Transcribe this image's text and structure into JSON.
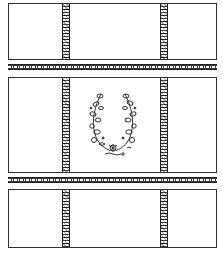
{
  "image": {
    "description": "Line-art pattern sheet: three rectangular panels separated by two decorative horizontal bands, each panel crossed by two decorative vertical strips; the middle panel contains a floral wreath motif",
    "colors": {
      "line": "#333333",
      "background": "#ffffff",
      "band_fill": "#3a3a3a"
    },
    "panels": [
      {
        "id": "top",
        "has_motif": false
      },
      {
        "id": "middle",
        "has_motif": true,
        "motif": "floral-wreath"
      },
      {
        "id": "bottom",
        "has_motif": false
      }
    ],
    "bands": [
      {
        "id": "band-1"
      },
      {
        "id": "band-2"
      }
    ]
  }
}
